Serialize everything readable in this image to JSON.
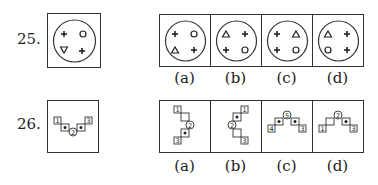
{
  "questions": [
    {
      "number": "25.",
      "question_figure": {
        "type": "circle-symbols",
        "symbols": {
          "top_left": "plus",
          "top_right": "circle",
          "bottom_left": "triangle-down",
          "bottom_right": "plus"
        }
      },
      "options": [
        {
          "label": "(a)",
          "symbols": {
            "top_left": "plus",
            "top_right": "circle",
            "bottom_left": "triangle-up",
            "bottom_right": "plus"
          }
        },
        {
          "label": "(b)",
          "symbols": {
            "top_left": "triangle-up",
            "top_right": "plus",
            "bottom_left": "plus",
            "bottom_right": "circle"
          }
        },
        {
          "label": "(c)",
          "symbols": {
            "top_left": "plus",
            "top_right": "triangle-up",
            "bottom_left": "plus",
            "bottom_right": "circle"
          }
        },
        {
          "label": "(d)",
          "symbols": {
            "top_left": "triangle-up",
            "top_right": "plus",
            "bottom_left": "circle",
            "bottom_right": "plus"
          }
        }
      ]
    },
    {
      "number": "26.",
      "question_figure": {
        "type": "step-chain",
        "labels": [
          "1",
          "2",
          "3"
        ],
        "orientation": "v-shape"
      },
      "options": [
        {
          "label": "(a)",
          "labels": [
            "1",
            "2",
            "3"
          ],
          "orientation": "vertical-zigzag-right"
        },
        {
          "label": "(b)",
          "labels": [
            "1",
            "2",
            "3"
          ],
          "orientation": "vertical-zigzag-left"
        },
        {
          "label": "(c)",
          "labels": [
            "4",
            "5",
            "3"
          ],
          "orientation": "inverted-v"
        },
        {
          "label": "(d)",
          "labels": [
            "1",
            "2",
            "3"
          ],
          "orientation": "inverted-v"
        }
      ]
    }
  ]
}
